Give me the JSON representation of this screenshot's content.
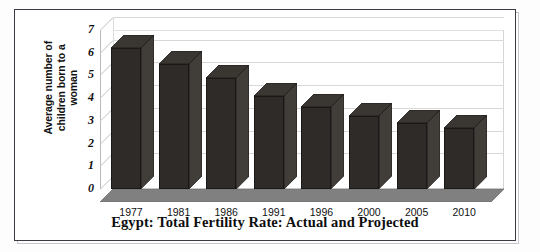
{
  "chart_data": {
    "type": "bar",
    "title": "Egypt: Total Fertility Rate: Actual and Projected",
    "xlabel": "",
    "ylabel": "Average number of children born to a woman",
    "categories": [
      "1977",
      "1981",
      "1986",
      "1991",
      "1996",
      "2000",
      "2005",
      "2010"
    ],
    "values": [
      6.2,
      5.5,
      4.9,
      4.1,
      3.6,
      3.2,
      2.9,
      2.7
    ],
    "series": [
      {
        "name": "Total Fertility Rate",
        "values": [
          6.2,
          5.5,
          4.9,
          4.1,
          3.6,
          3.2,
          2.9,
          2.7
        ]
      }
    ],
    "ylim": [
      0,
      7
    ],
    "yticks": [
      "0",
      "1",
      "2",
      "3",
      "4",
      "5",
      "6",
      "7"
    ],
    "grid": true,
    "legend": false,
    "style": "3d-column",
    "bar_color": "#2e2b28",
    "floor_color": "#808080",
    "gridline_color": "#d8d8d8"
  },
  "axes": {
    "y_title_line1": "Average number of",
    "y_title_line2": "children born to a",
    "y_title_line3": "woman"
  },
  "title": {
    "text": "Egypt: Total Fertility Rate: Actual and Projected"
  }
}
